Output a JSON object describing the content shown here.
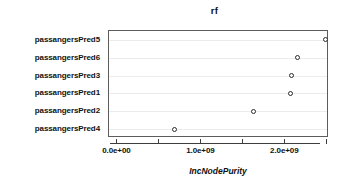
{
  "chart_data": {
    "type": "scatter",
    "title": "rf",
    "xlabel": "IncNodePurity",
    "ylabel": "",
    "categories": [
      "passangersPred5",
      "passangersPred6",
      "passangersPred3",
      "passangersPred1",
      "passangersPred2",
      "passangersPred4"
    ],
    "values": [
      2480000000,
      2140000000,
      2070000000,
      2060000000,
      1620000000,
      680000000
    ],
    "points": [
      {
        "label": "passangersPred5",
        "value": 2480000000
      },
      {
        "label": "passangersPred6",
        "value": 2140000000
      },
      {
        "label": "passangersPred3",
        "value": 2070000000
      },
      {
        "label": "passangersPred1",
        "value": 2060000000
      },
      {
        "label": "passangersPred2",
        "value": 1620000000
      },
      {
        "label": "passangersPred4",
        "value": 680000000
      }
    ],
    "xlim": [
      -100000000,
      2520000000
    ],
    "xticks": [
      0,
      500000000,
      1000000000,
      1500000000,
      2000000000,
      2500000000
    ],
    "xtick_labels": [
      "0.0e+00",
      "",
      "1.0e+09",
      "",
      "2.0e+09",
      ""
    ],
    "grid": true,
    "grid_axis": "y",
    "legend": "none",
    "marker": "open-circle",
    "colors": {
      "marker_stroke": "#2b2b2b",
      "marker_fill": "#ffffff",
      "frame": "#5c5c5c",
      "grid": "#ececec",
      "axis": "#3d3d3d",
      "text": "#111111",
      "background": "#ffffff"
    }
  }
}
